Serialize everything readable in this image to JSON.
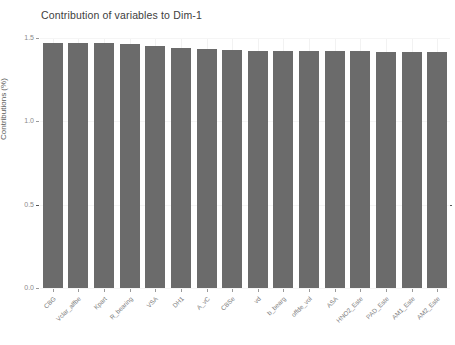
{
  "chart_data": {
    "type": "bar",
    "title": "Contribution of variables to Dim-1",
    "xlabel": "",
    "ylabel": "Contributions (%)",
    "ylim": [
      0.0,
      1.5
    ],
    "yticks": [
      "0.0",
      "0.5",
      "1.0",
      "1.5"
    ],
    "ytick_values": [
      0.0,
      0.5,
      1.0,
      1.5
    ],
    "grid": true,
    "legend": "none",
    "bar_color": "#6b6b6b",
    "reference_line": {
      "value": 0.5,
      "style": "dashed",
      "color": "#545454"
    },
    "categories": [
      "CBG",
      "Vclar_alfbe",
      "Kpart",
      "R_bearing",
      "VSA",
      "DH1",
      "A_vC",
      "CBSe",
      "vd",
      "b_bearg",
      "offde_vol",
      "ASA",
      "HNO2_Este",
      "PAD_Este",
      "AM1_Este",
      "AM2_Este"
    ],
    "values": [
      1.472,
      1.47,
      1.468,
      1.466,
      1.452,
      1.442,
      1.436,
      1.428,
      1.424,
      1.422,
      1.421,
      1.42,
      1.42,
      1.419,
      1.418,
      1.417
    ]
  },
  "axis": {
    "y_title": "Contributions (%)"
  }
}
